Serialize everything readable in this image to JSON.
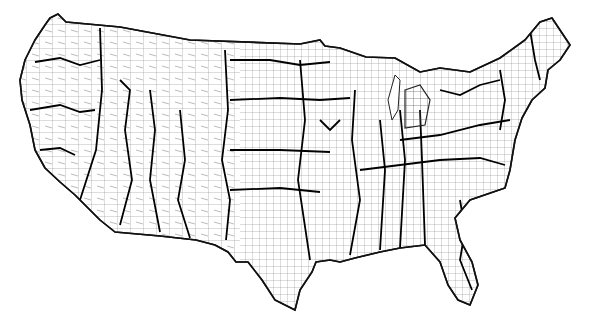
{
  "map": {
    "subject": "Contiguous United States county boundaries",
    "style": "black outline on white, counties with thin lines, regions with thick lines",
    "colors": {
      "background": "#ffffff",
      "lines": "#000000"
    },
    "labels": []
  }
}
